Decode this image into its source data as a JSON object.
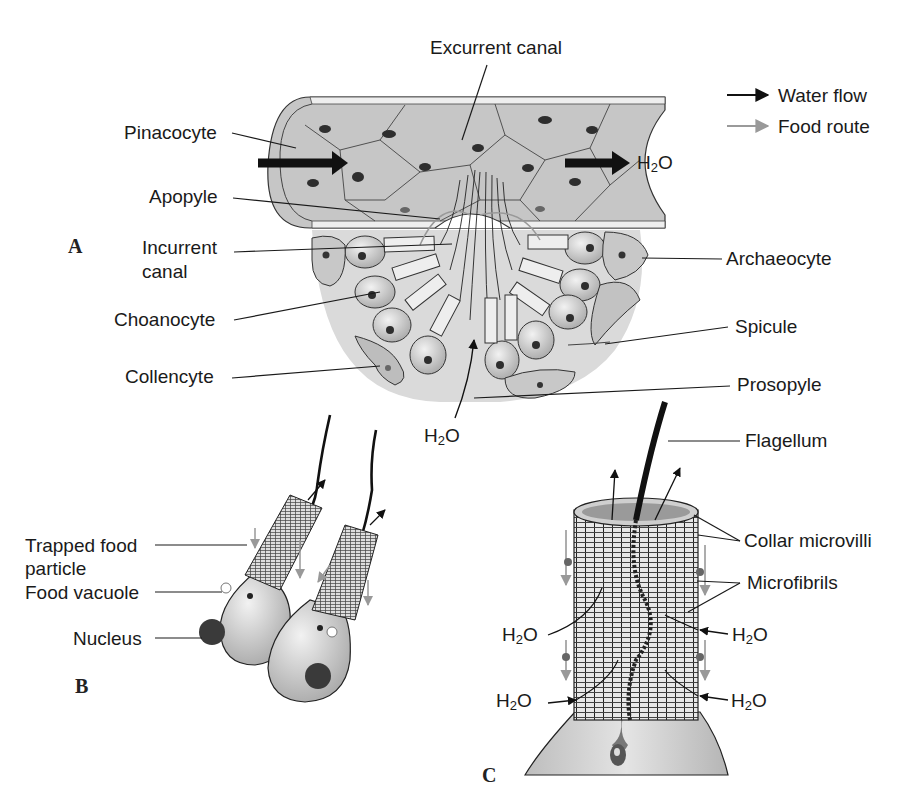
{
  "legend": {
    "water_flow": {
      "label": "Water flow",
      "color": "#111111"
    },
    "food_route": {
      "label": "Food route",
      "color": "#9a9a9a"
    }
  },
  "panels": {
    "a": {
      "letter": "A"
    },
    "b": {
      "letter": "B"
    },
    "c": {
      "letter": "C"
    }
  },
  "water": {
    "prefix": "H",
    "sub": "2",
    "suffix": "O"
  },
  "panel_a_labels": {
    "excurrent_canal": "Excurrent canal",
    "pinacocyte": "Pinacocyte",
    "apopyle": "Apopyle",
    "incurrent_canal_l1": "Incurrent",
    "incurrent_canal_l2": "canal",
    "choanocyte": "Choanocyte",
    "collencyte": "Collencyte",
    "archaeocyte": "Archaeocyte",
    "spicule": "Spicule",
    "prosopyle": "Prosopyle"
  },
  "panel_b_labels": {
    "trapped_food_l1": "Trapped food",
    "trapped_food_l2": "particle",
    "food_vacuole": "Food vacuole",
    "nucleus": "Nucleus"
  },
  "panel_c_labels": {
    "flagellum": "Flagellum",
    "collar_microvilli": "Collar microvilli",
    "microfibrils": "Microfibrils"
  },
  "colors": {
    "cell_fill": "#c9c9c9",
    "tissue_fill": "#dcdcdc",
    "nucleus_fill": "#3a3a3a",
    "line": "#222222"
  }
}
